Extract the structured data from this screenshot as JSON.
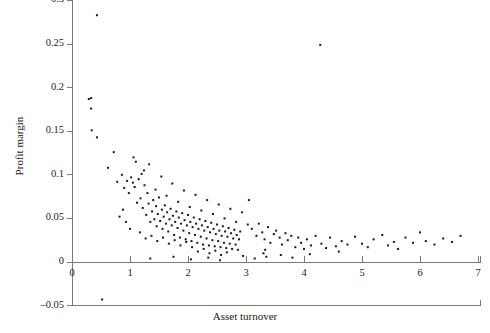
{
  "chart_data": {
    "type": "scatter",
    "title": "",
    "xlabel": "Asset turnover",
    "ylabel": "Profit margin",
    "xlim": [
      0,
      7.05
    ],
    "ylim": [
      -0.05,
      0.3
    ],
    "xticks": [
      0,
      1,
      2,
      3,
      4,
      5,
      6,
      7
    ],
    "xticklabels": [
      "0",
      "1",
      "2",
      "3",
      "4",
      "5",
      "6",
      "7"
    ],
    "yticks": [
      -0.05,
      0,
      0.05,
      0.1,
      0.15,
      0.2,
      0.25,
      0.3
    ],
    "yticklabels": [
      "-0.05",
      "0",
      "0.05",
      "0.1",
      "0.15",
      "0.2",
      "0.25",
      "0.3"
    ],
    "grid": false,
    "legend": null,
    "marker": "square",
    "marker_size": 2,
    "marker_color": "#1a1a1a",
    "axis_color": "#7a7a7a",
    "points": [
      [
        0.43,
        0.283
      ],
      [
        0.29,
        0.187
      ],
      [
        0.33,
        0.188
      ],
      [
        0.33,
        0.176
      ],
      [
        0.34,
        0.151
      ],
      [
        0.43,
        0.143
      ],
      [
        0.52,
        -0.043
      ],
      [
        4.28,
        0.249
      ],
      [
        0.62,
        0.108
      ],
      [
        0.78,
        0.092
      ],
      [
        0.86,
        0.1
      ],
      [
        0.9,
        0.085
      ],
      [
        0.95,
        0.093
      ],
      [
        0.98,
        0.079
      ],
      [
        1.02,
        0.097
      ],
      [
        1.05,
        0.091
      ],
      [
        1.08,
        0.086
      ],
      [
        1.12,
        0.068
      ],
      [
        1.15,
        0.095
      ],
      [
        1.18,
        0.073
      ],
      [
        1.2,
        0.101
      ],
      [
        1.22,
        0.062
      ],
      [
        1.25,
        0.088
      ],
      [
        1.28,
        0.054
      ],
      [
        1.3,
        0.079
      ],
      [
        1.32,
        0.067
      ],
      [
        1.35,
        0.046
      ],
      [
        1.38,
        0.058
      ],
      [
        1.4,
        0.071
      ],
      [
        1.42,
        0.049
      ],
      [
        1.45,
        0.064
      ],
      [
        1.46,
        0.041
      ],
      [
        1.48,
        0.055
      ],
      [
        1.5,
        0.074
      ],
      [
        1.52,
        0.047
      ],
      [
        1.55,
        0.06
      ],
      [
        1.56,
        0.038
      ],
      [
        1.58,
        0.052
      ],
      [
        1.6,
        0.065
      ],
      [
        1.62,
        0.044
      ],
      [
        1.64,
        0.057
      ],
      [
        1.66,
        0.035
      ],
      [
        1.68,
        0.049
      ],
      [
        1.7,
        0.061
      ],
      [
        1.72,
        0.042
      ],
      [
        1.74,
        0.053
      ],
      [
        1.76,
        0.031
      ],
      [
        1.78,
        0.046
      ],
      [
        1.8,
        0.058
      ],
      [
        1.82,
        0.039
      ],
      [
        1.84,
        0.051
      ],
      [
        1.86,
        0.028
      ],
      [
        1.88,
        0.044
      ],
      [
        1.9,
        0.056
      ],
      [
        1.92,
        0.036
      ],
      [
        1.94,
        0.048
      ],
      [
        1.96,
        0.026
      ],
      [
        1.98,
        0.042
      ],
      [
        2.0,
        0.054
      ],
      [
        2.02,
        0.033
      ],
      [
        2.04,
        0.046
      ],
      [
        2.06,
        0.024
      ],
      [
        2.08,
        0.04
      ],
      [
        2.1,
        0.051
      ],
      [
        2.12,
        0.031
      ],
      [
        2.14,
        0.044
      ],
      [
        2.16,
        0.022
      ],
      [
        2.18,
        0.038
      ],
      [
        2.2,
        0.049
      ],
      [
        2.22,
        0.029
      ],
      [
        2.24,
        0.042
      ],
      [
        2.26,
        0.02
      ],
      [
        2.28,
        0.036
      ],
      [
        2.3,
        0.047
      ],
      [
        2.32,
        0.027
      ],
      [
        2.34,
        0.04
      ],
      [
        2.36,
        0.019
      ],
      [
        2.38,
        0.034
      ],
      [
        2.4,
        0.045
      ],
      [
        2.42,
        0.025
      ],
      [
        2.44,
        0.038
      ],
      [
        2.46,
        0.018
      ],
      [
        2.48,
        0.032
      ],
      [
        2.5,
        0.043
      ],
      [
        2.52,
        0.024
      ],
      [
        2.54,
        0.036
      ],
      [
        2.56,
        0.017
      ],
      [
        2.58,
        0.03
      ],
      [
        2.6,
        0.041
      ],
      [
        2.62,
        0.022
      ],
      [
        2.64,
        0.035
      ],
      [
        2.66,
        0.016
      ],
      [
        2.68,
        0.029
      ],
      [
        2.7,
        0.039
      ],
      [
        2.72,
        0.021
      ],
      [
        2.74,
        0.033
      ],
      [
        2.76,
        0.015
      ],
      [
        2.78,
        0.027
      ],
      [
        2.8,
        0.037
      ],
      [
        2.82,
        0.02
      ],
      [
        2.84,
        0.031
      ],
      [
        2.86,
        0.014
      ],
      [
        2.88,
        0.026
      ],
      [
        2.9,
        0.035
      ],
      [
        1.1,
        0.115
      ],
      [
        1.24,
        0.105
      ],
      [
        1.33,
        0.112
      ],
      [
        1.44,
        0.083
      ],
      [
        1.54,
        0.098
      ],
      [
        1.63,
        0.076
      ],
      [
        1.73,
        0.09
      ],
      [
        1.83,
        0.069
      ],
      [
        1.93,
        0.082
      ],
      [
        2.03,
        0.063
      ],
      [
        2.13,
        0.077
      ],
      [
        2.23,
        0.059
      ],
      [
        2.33,
        0.071
      ],
      [
        2.43,
        0.055
      ],
      [
        2.53,
        0.066
      ],
      [
        2.63,
        0.05
      ],
      [
        2.73,
        0.061
      ],
      [
        2.83,
        0.046
      ],
      [
        2.93,
        0.057
      ],
      [
        3.03,
        0.043
      ],
      [
        1.17,
        0.034
      ],
      [
        1.27,
        0.027
      ],
      [
        1.37,
        0.03
      ],
      [
        1.47,
        0.024
      ],
      [
        1.57,
        0.028
      ],
      [
        1.67,
        0.021
      ],
      [
        1.77,
        0.025
      ],
      [
        1.87,
        0.019
      ],
      [
        1.97,
        0.023
      ],
      [
        2.07,
        0.017
      ],
      [
        2.17,
        0.012
      ],
      [
        2.27,
        0.015
      ],
      [
        2.37,
        0.01
      ],
      [
        2.47,
        0.013
      ],
      [
        2.57,
        0.008
      ],
      [
        2.67,
        0.011
      ],
      [
        1.35,
        0.004
      ],
      [
        1.75,
        0.006
      ],
      [
        2.05,
        0.003
      ],
      [
        2.35,
        0.005
      ],
      [
        2.55,
        0.002
      ],
      [
        2.95,
        0.007
      ],
      [
        3.15,
        0.004
      ],
      [
        3.05,
        0.071
      ],
      [
        3.1,
        0.038
      ],
      [
        3.18,
        0.03
      ],
      [
        3.22,
        0.044
      ],
      [
        3.28,
        0.034
      ],
      [
        3.32,
        0.026
      ],
      [
        3.38,
        0.04
      ],
      [
        3.42,
        0.022
      ],
      [
        3.48,
        0.032
      ],
      [
        3.52,
        0.036
      ],
      [
        3.58,
        0.028
      ],
      [
        3.62,
        0.02
      ],
      [
        3.68,
        0.033
      ],
      [
        3.72,
        0.025
      ],
      [
        3.78,
        0.03
      ],
      [
        3.85,
        0.017
      ],
      [
        3.9,
        0.028
      ],
      [
        3.95,
        0.022
      ],
      [
        4.0,
        0.015
      ],
      [
        4.05,
        0.026
      ],
      [
        4.12,
        0.019
      ],
      [
        4.2,
        0.03
      ],
      [
        4.3,
        0.021
      ],
      [
        4.38,
        0.016
      ],
      [
        4.45,
        0.028
      ],
      [
        4.55,
        0.018
      ],
      [
        4.65,
        0.024
      ],
      [
        4.75,
        0.02
      ],
      [
        4.88,
        0.029
      ],
      [
        5.0,
        0.021
      ],
      [
        5.1,
        0.017
      ],
      [
        5.2,
        0.026
      ],
      [
        5.35,
        0.031
      ],
      [
        5.45,
        0.019
      ],
      [
        5.55,
        0.023
      ],
      [
        5.62,
        0.015
      ],
      [
        5.75,
        0.028
      ],
      [
        5.88,
        0.022
      ],
      [
        6.0,
        0.034
      ],
      [
        6.1,
        0.024
      ],
      [
        6.25,
        0.02
      ],
      [
        6.4,
        0.027
      ],
      [
        6.55,
        0.023
      ],
      [
        6.7,
        0.03
      ],
      [
        3.3,
        0.01
      ],
      [
        3.35,
        0.006
      ],
      [
        3.33,
        0.014
      ],
      [
        3.6,
        0.008
      ],
      [
        4.1,
        0.009
      ],
      [
        4.6,
        0.012
      ],
      [
        3.8,
        0.005
      ],
      [
        0.72,
        0.126
      ],
      [
        0.88,
        0.06
      ],
      [
        0.93,
        0.046
      ],
      [
        1.0,
        0.038
      ],
      [
        1.06,
        0.12
      ],
      [
        0.82,
        0.052
      ]
    ]
  }
}
